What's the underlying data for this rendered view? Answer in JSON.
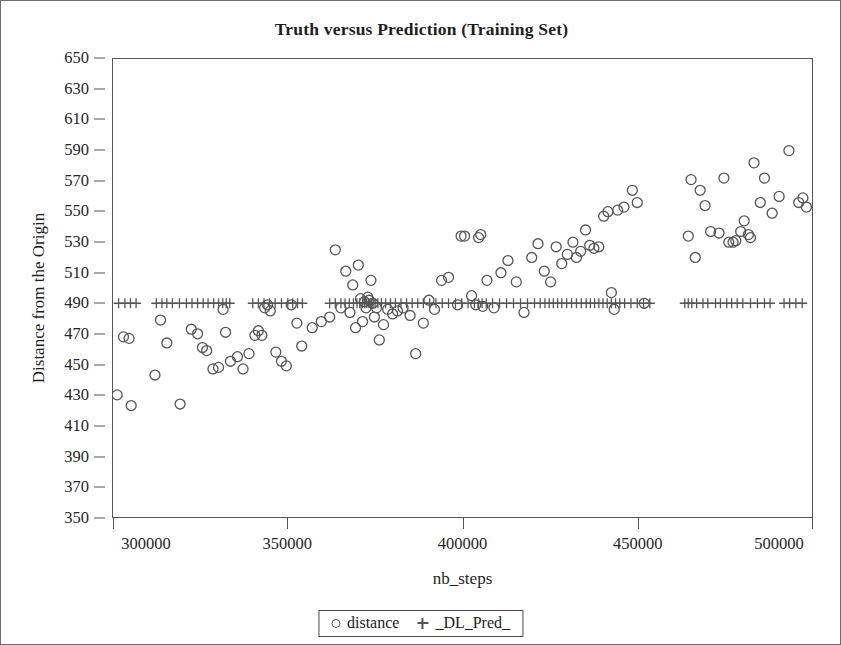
{
  "chart_data": {
    "type": "scatter",
    "title": "Truth versus Prediction (Training Set)",
    "xlabel": "nb_steps",
    "ylabel": "Distance from the Origin",
    "xlim": [
      300000,
      500000
    ],
    "ylim": [
      350,
      650
    ],
    "xticks": [
      300000,
      350000,
      400000,
      450000,
      500000
    ],
    "yticks": [
      350,
      370,
      390,
      410,
      430,
      450,
      470,
      490,
      510,
      530,
      550,
      570,
      590,
      610,
      630,
      650
    ],
    "grid": false,
    "legend_position": "bottom-center",
    "marker_color": "#555555",
    "series": [
      {
        "name": "distance",
        "marker": "circle-open",
        "points": [
          [
            301200,
            430
          ],
          [
            303000,
            468
          ],
          [
            304600,
            467
          ],
          [
            305200,
            423
          ],
          [
            312000,
            443
          ],
          [
            313600,
            479
          ],
          [
            315400,
            464
          ],
          [
            319200,
            424
          ],
          [
            322400,
            473
          ],
          [
            324200,
            470
          ],
          [
            325600,
            461
          ],
          [
            326800,
            459
          ],
          [
            328600,
            447
          ],
          [
            330200,
            448
          ],
          [
            331500,
            486
          ],
          [
            332200,
            471
          ],
          [
            333600,
            452
          ],
          [
            335600,
            455
          ],
          [
            337200,
            447
          ],
          [
            338900,
            457
          ],
          [
            340600,
            469
          ],
          [
            341600,
            472
          ],
          [
            342600,
            469
          ],
          [
            343400,
            487
          ],
          [
            344200,
            489
          ],
          [
            345000,
            485
          ],
          [
            346600,
            458
          ],
          [
            348200,
            452
          ],
          [
            349600,
            449
          ],
          [
            351000,
            489
          ],
          [
            352600,
            477
          ],
          [
            354000,
            462
          ],
          [
            357000,
            474
          ],
          [
            359600,
            478
          ],
          [
            362000,
            481
          ],
          [
            363600,
            525
          ],
          [
            365200,
            487
          ],
          [
            366600,
            511
          ],
          [
            367800,
            484
          ],
          [
            368600,
            502
          ],
          [
            369400,
            474
          ],
          [
            370200,
            515
          ],
          [
            370800,
            493
          ],
          [
            371400,
            478
          ],
          [
            371900,
            491
          ],
          [
            372400,
            487
          ],
          [
            372900,
            494
          ],
          [
            373300,
            492
          ],
          [
            373800,
            505
          ],
          [
            374300,
            490
          ],
          [
            374800,
            481
          ],
          [
            375400,
            487
          ],
          [
            376200,
            466
          ],
          [
            377400,
            476
          ],
          [
            378600,
            486
          ],
          [
            380000,
            483
          ],
          [
            381400,
            485
          ],
          [
            383000,
            487
          ],
          [
            385000,
            482
          ],
          [
            386600,
            457
          ],
          [
            388800,
            477
          ],
          [
            390400,
            492
          ],
          [
            392000,
            486
          ],
          [
            394000,
            505
          ],
          [
            396000,
            507
          ],
          [
            398600,
            489
          ],
          [
            399600,
            534
          ],
          [
            400600,
            534
          ],
          [
            402600,
            495
          ],
          [
            403800,
            489
          ],
          [
            404600,
            533
          ],
          [
            405200,
            535
          ],
          [
            405800,
            488
          ],
          [
            407000,
            505
          ],
          [
            409000,
            487
          ],
          [
            411000,
            510
          ],
          [
            413000,
            518
          ],
          [
            415400,
            504
          ],
          [
            417600,
            484
          ],
          [
            419800,
            520
          ],
          [
            421600,
            529
          ],
          [
            423400,
            511
          ],
          [
            425200,
            504
          ],
          [
            426800,
            527
          ],
          [
            428400,
            516
          ],
          [
            430000,
            522
          ],
          [
            431600,
            530
          ],
          [
            432600,
            520
          ],
          [
            433800,
            524
          ],
          [
            435200,
            538
          ],
          [
            436400,
            528
          ],
          [
            437600,
            526
          ],
          [
            439000,
            527
          ],
          [
            440400,
            547
          ],
          [
            441600,
            550
          ],
          [
            442600,
            497
          ],
          [
            443400,
            486
          ],
          [
            444400,
            551
          ],
          [
            446200,
            553
          ],
          [
            448600,
            564
          ],
          [
            450000,
            556
          ],
          [
            452000,
            490
          ],
          [
            464600,
            534
          ],
          [
            465400,
            571
          ],
          [
            466600,
            520
          ],
          [
            468000,
            564
          ],
          [
            469400,
            554
          ],
          [
            471000,
            537
          ],
          [
            473400,
            536
          ],
          [
            474800,
            572
          ],
          [
            476200,
            530
          ],
          [
            477400,
            530
          ],
          [
            478200,
            531
          ],
          [
            479600,
            537
          ],
          [
            480600,
            544
          ],
          [
            481800,
            535
          ],
          [
            482400,
            533
          ],
          [
            483400,
            582
          ],
          [
            485200,
            556
          ],
          [
            486400,
            572
          ],
          [
            488600,
            549
          ],
          [
            490600,
            560
          ],
          [
            493400,
            590
          ],
          [
            496200,
            556
          ],
          [
            497400,
            559
          ],
          [
            498400,
            553
          ]
        ]
      },
      {
        "name": "_DL_Pred_",
        "marker": "plus",
        "constant_y": 490,
        "points_x": [
          301600,
          303400,
          305000,
          306600,
          312400,
          314000,
          315400,
          317000,
          319000,
          321000,
          322600,
          324200,
          325800,
          327200,
          328800,
          330200,
          331400,
          332400,
          333400,
          340000,
          341600,
          343200,
          344800,
          346400,
          348200,
          350000,
          351400,
          352800,
          354200,
          362000,
          363600,
          365200,
          366400,
          367600,
          368800,
          369800,
          370600,
          371400,
          372000,
          372600,
          373200,
          373800,
          374400,
          375000,
          375800,
          376800,
          378000,
          379400,
          380800,
          382400,
          384000,
          385600,
          387200,
          388800,
          390600,
          392400,
          394200,
          396000,
          398000,
          399800,
          401600,
          403400,
          404600,
          405600,
          406800,
          408600,
          410600,
          412600,
          414600,
          416600,
          418600,
          420600,
          422200,
          423600,
          424800,
          426000,
          427200,
          428400,
          429800,
          431200,
          432600,
          434000,
          435400,
          436600,
          437800,
          439000,
          440200,
          441400,
          442600,
          443800,
          445000,
          446400,
          448200,
          450000,
          451800,
          453600,
          463600,
          464600,
          465600,
          467000,
          468800,
          470200,
          472400,
          473800,
          475600,
          477000,
          478600,
          480200,
          482400,
          484400,
          486400,
          488000,
          492000,
          493600,
          495400,
          497200
        ]
      }
    ]
  },
  "legend": {
    "entries": [
      {
        "label": "distance",
        "marker": "circle-open"
      },
      {
        "label": "_DL_Pred_",
        "marker": "plus"
      }
    ]
  }
}
